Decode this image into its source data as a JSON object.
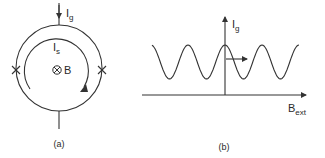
{
  "panel_a": {
    "caption": "(a)",
    "gate_current": {
      "symbol": "I",
      "subscript": "g"
    },
    "screening_current": {
      "symbol": "I",
      "subscript": "s"
    },
    "field": {
      "symbol_icon": "into-page-icon",
      "label": "B"
    },
    "junctions": [
      "left-junction",
      "right-junction"
    ]
  },
  "panel_b": {
    "caption": "(b)",
    "y_axis": {
      "symbol": "I",
      "subscript": "g"
    },
    "x_axis": {
      "symbol": "B",
      "subscript": "ext"
    }
  },
  "chart_data": {
    "type": "line",
    "title": "",
    "xlabel": "B_ext",
    "ylabel": "I_g",
    "series": [
      {
        "name": "I_g vs B_ext (periodic modulation)",
        "function": "cosine",
        "periods_shown": 4,
        "phase": "maximum at B_ext = 0",
        "relative_max": 1.0,
        "relative_min": 0.3
      }
    ],
    "annotations": [
      "arrow pointing in +B_ext direction at the central maximum"
    ],
    "grid": false,
    "legend": "none"
  }
}
